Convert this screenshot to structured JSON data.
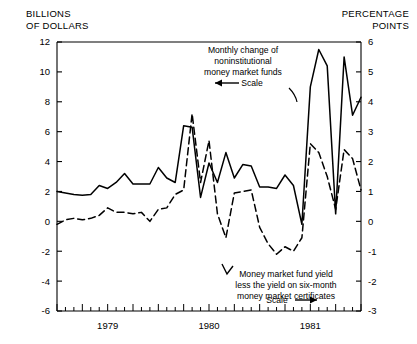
{
  "titles": {
    "left_axis_title_line1": "BILLIONS",
    "left_axis_title_line2": "OF DOLLARS",
    "right_axis_title_line1": "PERCENTAGE",
    "right_axis_title_line2": "POINTS"
  },
  "annotations": {
    "series1": {
      "line1": "Monthly change of",
      "line2": "noninstitutional",
      "line3": "money market funds",
      "scale_label": "Scale",
      "scale_arrow": "left"
    },
    "series2": {
      "line1": "Money market fund yield",
      "line2": "less the yield on six-month",
      "line3": "money market certificates",
      "scale_label": "Scale",
      "scale_arrow": "right"
    }
  },
  "chart_data": {
    "type": "line",
    "title": "",
    "xlabel": "",
    "ylabel": "BILLIONS OF DOLLARS",
    "y2label": "PERCENTAGE POINTS",
    "ylim": [
      -6,
      12
    ],
    "y2lim": [
      -3,
      6
    ],
    "yticks": [
      -6,
      -4,
      -2,
      0,
      2,
      4,
      6,
      8,
      10,
      12
    ],
    "ytick_labels": [
      "-6",
      "-4",
      "-2",
      "0",
      "2",
      "4",
      "6",
      "8",
      "10",
      "12"
    ],
    "y2ticks": [
      -3,
      -2,
      -1,
      0,
      1,
      2,
      3,
      4,
      5,
      6
    ],
    "y2tick_labels": [
      "-3",
      "-2",
      "-1",
      "0",
      "1",
      "2",
      "3",
      "4",
      "5",
      "6"
    ],
    "xtick_labels": [
      "1979",
      "1980",
      "1981"
    ],
    "xtick_positions": [
      6,
      18,
      30
    ],
    "x_minor_count": 38,
    "grid": false,
    "legend": "annotations",
    "x": [
      0,
      1,
      2,
      3,
      4,
      5,
      6,
      7,
      8,
      9,
      10,
      11,
      12,
      13,
      14,
      15,
      16,
      17,
      18,
      19,
      20,
      21,
      22,
      23,
      24,
      25,
      26,
      27,
      28,
      29,
      30,
      31,
      32,
      33,
      34,
      35,
      36
    ],
    "series": [
      {
        "name": "Monthly change of noninstitutional money market funds",
        "axis": "left",
        "units": "billions of dollars",
        "style": "solid",
        "values": [
          2.0,
          1.9,
          1.8,
          1.75,
          1.8,
          2.4,
          2.2,
          2.6,
          3.2,
          2.5,
          2.5,
          2.5,
          3.6,
          2.9,
          2.6,
          6.4,
          6.3,
          1.6,
          3.9,
          2.6,
          4.6,
          2.9,
          3.8,
          3.7,
          2.3,
          2.3,
          2.2,
          3.1,
          2.4,
          -0.2,
          9.0,
          11.5,
          10.4,
          0.5,
          11.0,
          7.1,
          8.3
        ]
      },
      {
        "name": "Money market fund yield less the yield on six-month money market certificates",
        "axis": "right",
        "units": "percentage points",
        "style": "dashed",
        "values": [
          -0.1,
          0.05,
          0.1,
          0.05,
          0.1,
          0.2,
          0.45,
          0.3,
          0.3,
          0.25,
          0.3,
          0.0,
          0.4,
          0.45,
          0.9,
          1.05,
          3.6,
          1.3,
          2.7,
          0.25,
          -0.55,
          0.95,
          1.0,
          1.05,
          -0.2,
          -0.75,
          -1.1,
          -0.85,
          -1.0,
          -0.55,
          2.6,
          2.3,
          1.5,
          0.4,
          2.4,
          2.1,
          1.05
        ]
      }
    ]
  }
}
